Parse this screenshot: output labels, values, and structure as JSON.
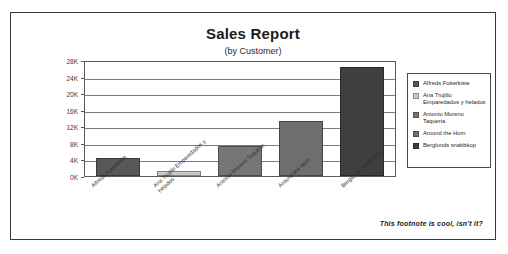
{
  "report": {
    "title": "Sales Report",
    "subtitle": "(by Customer)",
    "footnote": "This footnote is cool, isn't it?"
  },
  "chart_data": {
    "type": "bar",
    "title": "Sales Report",
    "subtitle": "(by Customer)",
    "xlabel": "",
    "ylabel": "",
    "ylim": [
      0,
      28000
    ],
    "ytick_labels": [
      "0K",
      "4K",
      "8K",
      "12K",
      "16K",
      "20K",
      "24K",
      "28K"
    ],
    "ytick_values": [
      0,
      4000,
      8000,
      12000,
      16000,
      20000,
      24000,
      28000
    ],
    "grid": true,
    "legend_position": "right",
    "categories": [
      "Alfreds Futterkiste",
      "Ana Trujillo Emparedados y helados",
      "Antonio Moreno Taqueria",
      "Around the Horn",
      "Berglunds snabbkop"
    ],
    "values": [
      4300,
      1100,
      7300,
      13300,
      26300
    ],
    "colors": [
      "#585858",
      "#c9c9c9",
      "#767676",
      "#6e6e6e",
      "#3f3f3f"
    ],
    "series": [
      {
        "name": "Sales",
        "values": [
          4300,
          1100,
          7300,
          13300,
          26300
        ]
      }
    ]
  },
  "legend": {
    "items": [
      {
        "label": "Alfreds Futterkiste",
        "color": "#585858"
      },
      {
        "label": "Ana Trujillo Emparedados y helados",
        "color": "#c9c9c9"
      },
      {
        "label": "Antonio Moreno Taqueria",
        "color": "#767676"
      },
      {
        "label": "Around the Horn",
        "color": "#6e6e6e"
      },
      {
        "label": "Berglunds snabbkop",
        "color": "#3f3f3f"
      }
    ]
  }
}
